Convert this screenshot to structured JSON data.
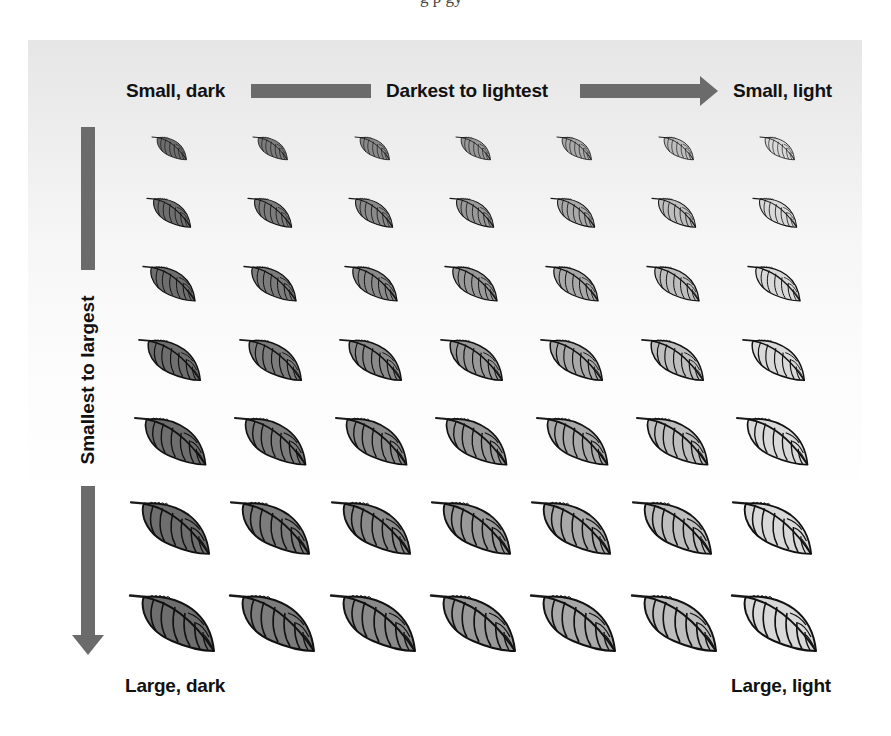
{
  "page": {
    "cropped_top_text": "g                                     p                                gy"
  },
  "figure": {
    "top_left_label": "Small, dark",
    "top_axis_label": "Darkest to lightest",
    "top_right_label": "Small, light",
    "left_axis_label": "Smallest to largest",
    "bottom_left_label": "Large, dark",
    "bottom_right_label": "Large, light",
    "arrow_color": "#6b6b6b",
    "background_gradient": [
      "#e6e6e6",
      "#ffffff"
    ]
  },
  "grid": {
    "rows": 7,
    "columns": 7,
    "leaf_icon": "leaf-icon",
    "column_fill_colors": [
      "#6e6e6e",
      "#7c7c7c",
      "#8a8a8a",
      "#999999",
      "#a9a9a9",
      "#bebebe",
      "#d9d9d9"
    ],
    "row_scales": [
      0.41,
      0.52,
      0.62,
      0.73,
      0.84,
      0.93,
      1.0
    ],
    "row_top_y": [
      136,
      197,
      265,
      338,
      416,
      500,
      593
    ],
    "row_first_x": [
      152,
      147,
      143,
      139,
      135,
      131,
      130
    ],
    "column_spacing": [
      101.3,
      101.0,
      100.8,
      100.6,
      100.4,
      100.3,
      100.3
    ]
  }
}
